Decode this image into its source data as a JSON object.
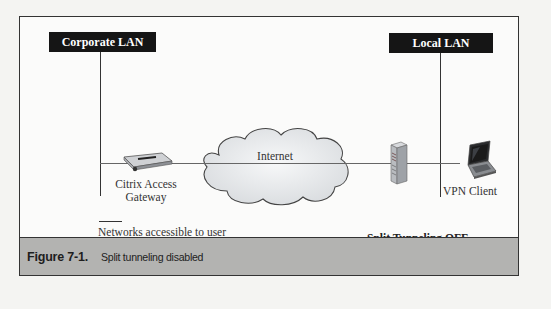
{
  "diagram": {
    "networks": [
      {
        "id": "corporate",
        "label": "Corporate LAN"
      },
      {
        "id": "local",
        "label": "Local LAN"
      }
    ],
    "cloud": {
      "label": "Internet"
    },
    "devices": [
      {
        "id": "gateway",
        "icon": "gateway-appliance-icon",
        "label_line1": "Citrix Access",
        "label_line2": "Gateway"
      },
      {
        "id": "server",
        "icon": "tower-server-icon"
      },
      {
        "id": "vpn-client",
        "icon": "laptop-icon",
        "label": "VPN Client"
      }
    ],
    "legend": {
      "text": "Networks accessible to user"
    },
    "status": "Split Tunneling OFF"
  },
  "caption": {
    "number": "Figure 7-1.",
    "title": "Split tunneling disabled"
  },
  "colors": {
    "frame": "#333333",
    "caption_bg": "#b3b3b1",
    "lan_box_bg": "#151515",
    "cloud_fill": "#e6e8ea",
    "line": "#666666"
  }
}
